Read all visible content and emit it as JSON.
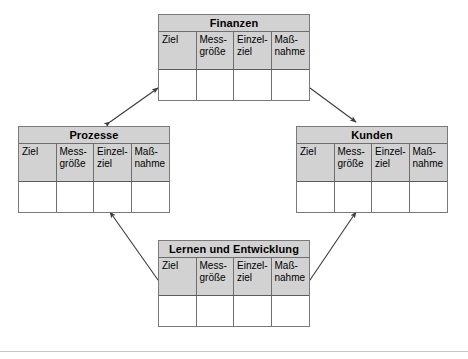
{
  "diagram": {
    "language": "de",
    "background_color": "#ffffff",
    "header_fill": "#d2d2d2",
    "border_color": "#6e6e6e",
    "arrow_color": "#3a3a3a",
    "column_headers": [
      "Ziel",
      "Mess-größe",
      "Einzel-ziel",
      "Maß-nahme"
    ],
    "perspectives": [
      {
        "id": "finanzen",
        "title": "Finanzen",
        "columns": [
          "Ziel",
          "Mess-größe",
          "Einzel-ziel",
          "Maß-nahme"
        ],
        "rows": [
          [
            "",
            "",
            "",
            ""
          ]
        ]
      },
      {
        "id": "prozesse",
        "title": "Prozesse",
        "columns": [
          "Ziel",
          "Mess-größe",
          "Einzel-ziel",
          "Maß-nahme"
        ],
        "rows": [
          [
            "",
            "",
            "",
            ""
          ]
        ]
      },
      {
        "id": "kunden",
        "title": "Kunden",
        "columns": [
          "Ziel",
          "Mess-größe",
          "Einzel-ziel",
          "Maß-nahme"
        ],
        "rows": [
          [
            "",
            "",
            "",
            ""
          ]
        ]
      },
      {
        "id": "lernen",
        "title": "Lernen und Entwicklung",
        "columns": [
          "Ziel",
          "Mess-größe",
          "Einzel-ziel",
          "Maß-nahme"
        ],
        "rows": [
          [
            "",
            "",
            "",
            ""
          ]
        ]
      }
    ],
    "connectors": [
      {
        "id": "prozesse-finanzen",
        "from": "prozesse",
        "to": "finanzen",
        "style": "double-headed"
      },
      {
        "id": "finanzen-kunden",
        "from": "finanzen",
        "to": "kunden",
        "style": "double-headed"
      },
      {
        "id": "lernen-prozesse",
        "from": "lernen",
        "to": "prozesse",
        "style": "double-headed"
      },
      {
        "id": "lernen-kunden",
        "from": "lernen",
        "to": "kunden",
        "style": "double-headed"
      }
    ]
  }
}
